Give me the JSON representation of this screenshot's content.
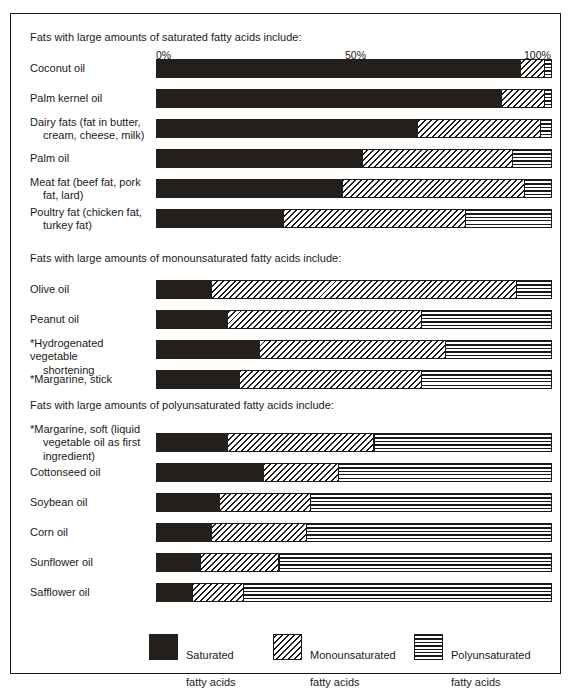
{
  "chart_data": {
    "type": "bar",
    "subtype": "stacked-horizontal-100pct",
    "title": "",
    "xlabel": "",
    "ylabel": "",
    "xlim": [
      0,
      100
    ],
    "grid": false,
    "legend_position": "bottom",
    "axis_ticks": [
      "0%",
      "50%",
      "100%"
    ],
    "axis_tick_values": [
      0,
      50,
      100
    ],
    "series": [
      {
        "name": "Saturated fatty acids",
        "pattern": "solid-black"
      },
      {
        "name": "Monounsaturated fatty acids",
        "pattern": "diagonal-hatch"
      },
      {
        "name": "Polyunsaturated fatty acids",
        "pattern": "horizontal-lines"
      }
    ],
    "groups": [
      {
        "heading": "Fats with large amounts of saturated fatty acids include:",
        "rows": [
          {
            "label": "Coconut oil",
            "label2": "",
            "values": [
              92,
              6,
              2
            ]
          },
          {
            "label": "Palm kernel oil",
            "label2": "",
            "values": [
              87,
              11,
              2
            ]
          },
          {
            "label": "Dairy fats (fat in butter,",
            "label2": "cream, cheese, milk)",
            "values": [
              66,
              31,
              3
            ]
          },
          {
            "label": "Palm oil",
            "label2": "",
            "values": [
              52,
              38,
              10
            ]
          },
          {
            "label": "Meat fat (beef fat, pork",
            "label2": "fat, lard)",
            "values": [
              47,
              46,
              7
            ]
          },
          {
            "label": "Poultry fat (chicken fat,",
            "label2": "turkey fat)",
            "values": [
              32,
              46,
              22
            ]
          }
        ]
      },
      {
        "heading": "Fats with large amounts of monounsaturated fatty acids include:",
        "rows": [
          {
            "label": "Olive oil",
            "label2": "",
            "values": [
              14,
              77,
              9
            ]
          },
          {
            "label": "Peanut oil",
            "label2": "",
            "values": [
              18,
              49,
              33
            ]
          },
          {
            "label": "*Hydrogenated vegetable",
            "label2": "shortening",
            "values": [
              26,
              47,
              27
            ]
          },
          {
            "label": "*Margarine, stick",
            "label2": "",
            "values": [
              21,
              46,
              33
            ]
          }
        ]
      },
      {
        "heading": "Fats with large amounts of polyunsaturated fatty acids include:",
        "rows": [
          {
            "label": "*Margarine, soft (liquid",
            "label2": "vegetable oil as first|ingredient)",
            "values": [
              18,
              37,
              45
            ]
          },
          {
            "label": "Cottonseed oil",
            "label2": "",
            "values": [
              27,
              19,
              54
            ]
          },
          {
            "label": "Soybean oil",
            "label2": "",
            "values": [
              16,
              23,
              61
            ]
          },
          {
            "label": "Corn oil",
            "label2": "",
            "values": [
              14,
              24,
              62
            ]
          },
          {
            "label": "Sunflower oil",
            "label2": "",
            "values": [
              11,
              20,
              69
            ]
          },
          {
            "label": "Safflower oil",
            "label2": "",
            "values": [
              9,
              13,
              78
            ]
          }
        ]
      }
    ],
    "legend": [
      {
        "swatch": "solid-black",
        "line1": "Saturated",
        "line2": "fatty acids"
      },
      {
        "swatch": "diagonal-hatch",
        "line1": "Monounsaturated",
        "line2": "fatty acids"
      },
      {
        "swatch": "horizontal-lines",
        "line1": "Polyunsaturated",
        "line2": "fatty acids"
      }
    ],
    "colors": {
      "saturated": "#241f1a",
      "monounsaturated": "#ffffff",
      "polyunsaturated": "#ffffff",
      "ink": "#1a1a1a",
      "background": "#ffffff"
    }
  },
  "axis": {
    "tick0": "0%",
    "tick50": "50%",
    "tick100": "100%"
  },
  "headings": {
    "g0": "Fats with large amounts of saturated fatty acids include:",
    "g1": "Fats with large amounts of monounsaturated fatty acids include:",
    "g2": "Fats with large amounts of polyunsaturated fatty acids include:"
  },
  "legend": {
    "sat_l1": "Saturated",
    "sat_l2": "fatty acids",
    "mono_l1": "Monounsaturated",
    "mono_l2": "fatty acids",
    "poly_l1": "Polyunsaturated",
    "poly_l2": "fatty acids"
  }
}
